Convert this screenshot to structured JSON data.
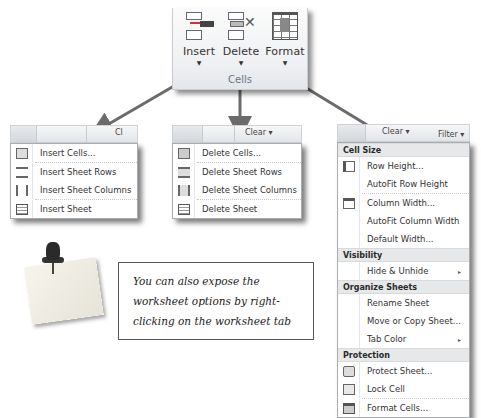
{
  "ribbon": {
    "group_label": "Cells",
    "buttons": [
      {
        "label": "Insert",
        "icon": "insert-cells-icon"
      },
      {
        "label": "Delete",
        "icon": "delete-cells-icon"
      },
      {
        "label": "Format",
        "icon": "format-cells-icon"
      }
    ],
    "dropdown_glyph": "▼"
  },
  "insert_menu": {
    "top_clear": "Cl",
    "items": [
      {
        "label": "Insert Cells...",
        "icon": "insert-cells-icon"
      },
      {
        "label": "Insert Sheet Rows",
        "icon": "insert-rows-icon"
      },
      {
        "label": "Insert Sheet Columns",
        "icon": "insert-columns-icon"
      },
      {
        "label": "Insert Sheet",
        "icon": "insert-sheet-icon"
      }
    ]
  },
  "delete_menu": {
    "top_clear": "Clear ▾",
    "items": [
      {
        "label": "Delete Cells...",
        "icon": "delete-cells-icon"
      },
      {
        "label": "Delete Sheet Rows",
        "icon": "delete-rows-icon"
      },
      {
        "label": "Delete Sheet Columns",
        "icon": "delete-columns-icon"
      },
      {
        "label": "Delete Sheet",
        "icon": "delete-sheet-icon"
      }
    ]
  },
  "format_menu": {
    "top_clear": "Clear ▾",
    "top_filter": "Filter ▾",
    "top_sort": "Sort &",
    "sections": [
      {
        "header": "Cell Size",
        "items": [
          {
            "label": "Row Height...",
            "icon": "row-height-icon"
          },
          {
            "label": "AutoFit Row Height"
          },
          {
            "label": "Column Width...",
            "icon": "column-width-icon"
          },
          {
            "label": "AutoFit Column Width"
          },
          {
            "label": "Default Width..."
          }
        ]
      },
      {
        "header": "Visibility",
        "items": [
          {
            "label": "Hide & Unhide",
            "submenu": true
          }
        ]
      },
      {
        "header": "Organize Sheets",
        "items": [
          {
            "label": "Rename Sheet"
          },
          {
            "label": "Move or Copy Sheet..."
          },
          {
            "label": "Tab Color",
            "submenu": true
          }
        ]
      },
      {
        "header": "Protection",
        "items": [
          {
            "label": "Protect Sheet...",
            "icon": "protect-sheet-icon"
          },
          {
            "label": "Lock Cell",
            "icon": "lock-cell-icon"
          },
          {
            "label": "Format Cells...",
            "icon": "format-cells-icon"
          }
        ]
      }
    ],
    "submenu_glyph": "▸"
  },
  "note": {
    "text": "You can also expose the worksheet options by right-clicking on the worksheet tab"
  },
  "colors": {
    "arrow": "#6b6b6b",
    "menu_header_bg": "#e6e8ea",
    "ribbon_label": "#6a7585"
  }
}
